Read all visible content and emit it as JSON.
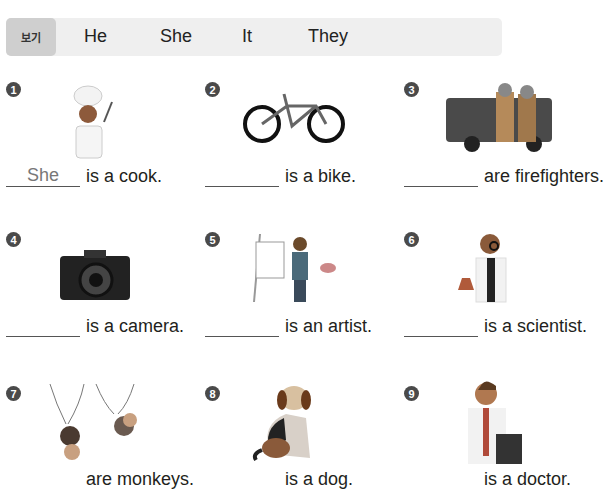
{
  "word_box": {
    "tag": "보기",
    "words": [
      "He",
      "She",
      "It",
      "They"
    ]
  },
  "items": [
    {
      "number": "1",
      "picture": "cook-icon",
      "answer": "She",
      "sentence": "is a cook."
    },
    {
      "number": "2",
      "picture": "bike-icon",
      "answer": "",
      "sentence": "is a bike."
    },
    {
      "number": "3",
      "picture": "firefighters-icon",
      "answer": "",
      "sentence": "are firefighters."
    },
    {
      "number": "4",
      "picture": "camera-icon",
      "answer": "",
      "sentence": "is a camera."
    },
    {
      "number": "5",
      "picture": "artist-icon",
      "answer": "",
      "sentence": "is an artist."
    },
    {
      "number": "6",
      "picture": "scientist-icon",
      "answer": "",
      "sentence": "is a scientist."
    },
    {
      "number": "7",
      "picture": "monkeys-icon",
      "answer": "",
      "sentence": "are monkeys."
    },
    {
      "number": "8",
      "picture": "dog-icon",
      "answer": "",
      "sentence": "is a dog."
    },
    {
      "number": "9",
      "picture": "doctor-icon",
      "answer": "",
      "sentence": "is a doctor."
    }
  ]
}
